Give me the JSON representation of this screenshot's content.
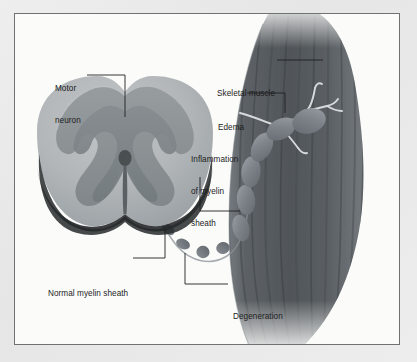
{
  "figure": {
    "kind": "medical-illustration",
    "background_color": "#e9e9e9",
    "plate_color": "#fbfbfa",
    "frame_color": "#6f7173",
    "text_color": "#1c1c1c",
    "leader_color": "#1f1f1f"
  },
  "labels": {
    "motor_neuron": {
      "line1": "Motor",
      "line2": "neuron"
    },
    "skeletal_muscle": {
      "line1": "Skeletal muscle"
    },
    "edema": {
      "line1": "Edema"
    },
    "inflammation": {
      "line1": "Inflammation",
      "line2": "of myelin",
      "line3": "sheath"
    },
    "normal_myelin": {
      "line1": "Normal myelin sheath"
    },
    "degeneration": {
      "line1": "Degeneration",
      "line2": "of myelin",
      "line3": "sheath"
    }
  },
  "structures": {
    "spinal_cord": {
      "name": "spinal cord cross-section",
      "white_matter_color": "#b2b6b9",
      "gray_matter_color": "#8d9295",
      "inner_gray_color": "#7b8184",
      "central_canal_color": "#4f5457",
      "shadow_color": "#2b2d2f"
    },
    "axon": {
      "name": "myelinated axon chain",
      "healthy_segment_color": "#7f858a",
      "inflamed_segment_color": "#6f757a",
      "degenerated_segment_color": "#6a7075",
      "segments_total": 12,
      "degenerated_segments": 4
    },
    "muscle": {
      "name": "skeletal muscle belly",
      "fiber_color": "#5c6165",
      "striation_color": "#494e52",
      "nerve_terminal_color": "#d5d8da",
      "striation_count": 11
    }
  }
}
